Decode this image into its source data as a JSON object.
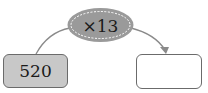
{
  "diagram": {
    "operation": {
      "label": "×13",
      "fill": "#9a9a9a"
    },
    "input_box": {
      "value": "520",
      "fill": "#c8c8c8"
    },
    "output_box": {
      "value": ""
    }
  }
}
